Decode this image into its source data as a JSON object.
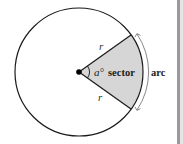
{
  "diagram": {
    "labels": {
      "radius_upper": "r",
      "radius_lower": "r",
      "angle": "a°",
      "sector": "sector",
      "arc": "arc"
    },
    "colors": {
      "stroke": "#1a1a1a",
      "sector_fill": "#d6d6d6",
      "arrow": "#7a7a7a",
      "background": "#ffffff",
      "border": "#9a9a9a"
    }
  }
}
